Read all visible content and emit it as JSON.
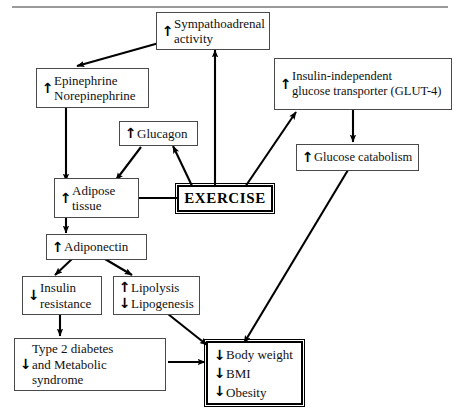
{
  "figure": {
    "type": "flowchart",
    "title": "",
    "has_top_rule": true,
    "arrow_glyphs": {
      "up": "↑",
      "down": "↓"
    },
    "colors": {
      "background": "#ffffff",
      "box_border": "#4a4a4a",
      "emphasis_border": "#000000",
      "edge": "#000000",
      "rule": "#9a9a9a",
      "text": "#111111"
    }
  },
  "nodes": {
    "sympathoadrenal": {
      "id": "sympathoadrenal",
      "label": "Sympathoadrenal\nactivity",
      "arrows": [
        "↑"
      ],
      "arrow_mode": "single"
    },
    "epinephrine": {
      "id": "epinephrine",
      "label": "Epinephrine\nNorepinephrine",
      "arrows": [
        "↑"
      ],
      "arrow_mode": "single"
    },
    "glut4": {
      "id": "glut4",
      "label": "Insulin-independent\nglucose transporter (GLUT-4)",
      "arrows": [
        "↑"
      ],
      "arrow_mode": "single"
    },
    "glucagon": {
      "id": "glucagon",
      "label": "Glucagon",
      "arrows": [
        "↑"
      ],
      "arrow_mode": "single"
    },
    "glucose_catabolism": {
      "id": "glucose_catabolism",
      "label": "Glucose catabolism",
      "arrows": [
        "↑"
      ],
      "arrow_mode": "single"
    },
    "adipose": {
      "id": "adipose",
      "label": "Adipose\ntissue",
      "arrows": [
        "↑"
      ],
      "arrow_mode": "single"
    },
    "exercise": {
      "id": "exercise",
      "label": "EXERCISE",
      "arrows": [],
      "arrow_mode": "none",
      "emphasis": true
    },
    "adiponectin": {
      "id": "adiponectin",
      "label": "Adiponectin",
      "arrows": [
        "↑"
      ],
      "arrow_mode": "single"
    },
    "insulin_resistance": {
      "id": "insulin_resistance",
      "label": "Insulin\nresistance",
      "arrows": [
        "↓"
      ],
      "arrow_mode": "single"
    },
    "lipolysis": {
      "id": "lipolysis",
      "label": "Lipolysis\nLipogenesis",
      "arrows": [
        "↑",
        "↓"
      ],
      "arrow_mode": "split"
    },
    "diabetes": {
      "id": "diabetes",
      "label": "Type 2 diabetes\nand Metabolic\nsyndrome",
      "arrows": [
        "↓"
      ],
      "arrow_mode": "single"
    },
    "bodyweight": {
      "id": "bodyweight",
      "label": "Body weight\nBMI\nObesity",
      "arrows": [
        "↓",
        "↓",
        "↓"
      ],
      "arrow_mode": "split",
      "emphasis": true
    }
  },
  "edges": [
    {
      "from": "sympathoadrenal",
      "to": "epinephrine",
      "style": "solid-arrow"
    },
    {
      "from": "exercise",
      "to": "sympathoadrenal",
      "style": "solid-arrow"
    },
    {
      "from": "exercise",
      "to": "glut4",
      "style": "solid-arrow"
    },
    {
      "from": "exercise",
      "to": "glucagon",
      "style": "solid-arrow"
    },
    {
      "from": "exercise",
      "to": "adipose",
      "style": "solid-arrow"
    },
    {
      "from": "epinephrine",
      "to": "adipose",
      "style": "solid-arrow"
    },
    {
      "from": "glucagon",
      "to": "adipose",
      "style": "solid-arrow"
    },
    {
      "from": "glut4",
      "to": "glucose_catabolism",
      "style": "solid-arrow"
    },
    {
      "from": "glucose_catabolism",
      "to": "bodyweight",
      "style": "solid-arrow"
    },
    {
      "from": "adipose",
      "to": "adiponectin",
      "style": "solid-arrow"
    },
    {
      "from": "adiponectin",
      "to": "insulin_resistance",
      "style": "solid-arrow"
    },
    {
      "from": "adiponectin",
      "to": "lipolysis",
      "style": "solid-arrow"
    },
    {
      "from": "insulin_resistance",
      "to": "diabetes",
      "style": "solid-arrow"
    },
    {
      "from": "lipolysis",
      "to": "bodyweight",
      "style": "solid-arrow"
    },
    {
      "from": "diabetes",
      "to": "bodyweight",
      "style": "solid-arrow"
    }
  ]
}
